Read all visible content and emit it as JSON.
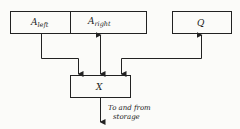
{
  "diagram": {
    "registers": {
      "a_left": {
        "main": "A",
        "sub": "left"
      },
      "a_right": {
        "main": "A",
        "sub": "right"
      },
      "q": {
        "main": "Q"
      },
      "x": {
        "main": "X"
      }
    },
    "storage_label": {
      "line1": "To and from",
      "line2": "storage"
    },
    "connections": [
      {
        "from": "A_left",
        "to": "X",
        "direction": "one-way"
      },
      {
        "from": "A_right",
        "to": "X",
        "direction": "two-way"
      },
      {
        "from": "X",
        "to": "Q",
        "direction": "two-way"
      },
      {
        "from": "X",
        "to": "storage",
        "direction": "two-way"
      }
    ],
    "colors": {
      "line": "#222222",
      "background": "#fbfbf9"
    }
  }
}
